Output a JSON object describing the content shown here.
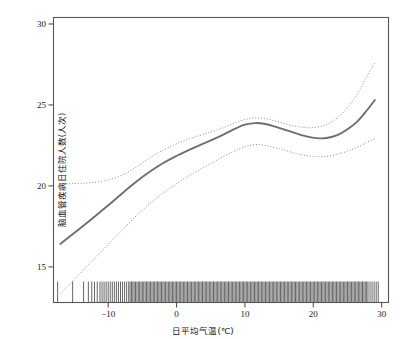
{
  "chart_data": {
    "type": "line",
    "title": "",
    "xlabel": "日平均气温(℃)",
    "ylabel": "脑血管疾病日住院人数(人次)",
    "xlim": [
      -18,
      31
    ],
    "ylim": [
      12.8,
      30.4
    ],
    "xticks": [
      -10,
      0,
      10,
      20,
      30
    ],
    "xtick_labels": [
      "−10",
      "0",
      "10",
      "20",
      "30"
    ],
    "yticks": [
      15,
      20,
      25,
      30
    ],
    "ytick_labels": [
      "15",
      "20",
      "25",
      "30"
    ],
    "grid": false,
    "legend": "none",
    "line_color": "#6e6e73",
    "ci_color": "#8c8c92",
    "rug_color": "#4a4a4a",
    "axis_color": "#555558",
    "series": [
      {
        "name": "estimate",
        "style": "solid",
        "x": [
          -17.0,
          -15.5,
          -14.0,
          -12.5,
          -11.0,
          -9.5,
          -8.0,
          -6.5,
          -5.0,
          -3.5,
          -2.0,
          -0.5,
          1.0,
          2.5,
          4.0,
          5.5,
          7.0,
          8.5,
          10.0,
          11.5,
          13.0,
          14.5,
          16.0,
          17.5,
          19.0,
          20.5,
          22.0,
          23.5,
          25.0,
          26.5,
          28.0,
          29.0
        ],
        "y": [
          16.42,
          16.92,
          17.42,
          17.93,
          18.45,
          18.98,
          19.52,
          20.05,
          20.55,
          21.0,
          21.4,
          21.75,
          22.06,
          22.35,
          22.62,
          22.9,
          23.2,
          23.52,
          23.78,
          23.88,
          23.82,
          23.65,
          23.45,
          23.24,
          23.06,
          22.95,
          22.96,
          23.13,
          23.5,
          24.0,
          24.75,
          25.3
        ]
      },
      {
        "name": "upper_confidence_limit",
        "style": "dotted",
        "x": [
          -17.0,
          -15.5,
          -14.0,
          -12.5,
          -11.0,
          -9.5,
          -8.0,
          -6.5,
          -5.0,
          -3.5,
          -2.0,
          -0.5,
          1.0,
          2.5,
          4.0,
          5.5,
          7.0,
          8.5,
          10.0,
          11.5,
          13.0,
          14.5,
          16.0,
          17.5,
          19.0,
          20.5,
          22.0,
          23.5,
          25.0,
          26.5,
          28.0,
          29.0
        ],
        "y": [
          20.15,
          20.14,
          20.16,
          20.2,
          20.28,
          20.42,
          20.66,
          21.0,
          21.42,
          21.85,
          22.2,
          22.5,
          22.78,
          23.0,
          23.2,
          23.4,
          23.62,
          23.88,
          24.1,
          24.2,
          24.15,
          24.0,
          23.82,
          23.68,
          23.6,
          23.62,
          23.8,
          24.2,
          24.85,
          25.7,
          26.9,
          27.6
        ]
      },
      {
        "name": "lower_confidence_limit",
        "style": "dotted",
        "x": [
          -17.0,
          -15.5,
          -14.0,
          -12.5,
          -11.0,
          -9.5,
          -8.0,
          -6.5,
          -5.0,
          -3.5,
          -2.0,
          -0.5,
          1.0,
          2.5,
          4.0,
          5.5,
          7.0,
          8.5,
          10.0,
          11.5,
          13.0,
          14.5,
          16.0,
          17.5,
          19.0,
          20.5,
          22.0,
          23.5,
          25.0,
          26.5,
          28.0,
          29.0
        ],
        "y": [
          13.35,
          14.0,
          14.65,
          15.3,
          15.95,
          16.6,
          17.25,
          17.9,
          18.5,
          19.05,
          19.55,
          20.0,
          20.42,
          20.8,
          21.15,
          21.5,
          21.85,
          22.15,
          22.42,
          22.55,
          22.5,
          22.35,
          22.18,
          22.0,
          21.88,
          21.8,
          21.82,
          21.95,
          22.15,
          22.4,
          22.72,
          22.9
        ]
      }
    ],
    "rug": {
      "name": "observation-rug",
      "x": [
        -17.4,
        -15.2,
        -13.6,
        -12.9,
        -12.4,
        -12.0,
        -11.6,
        -11.2,
        -10.9,
        -10.6,
        -10.3,
        -10.0,
        -9.7,
        -9.4,
        -9.1,
        -8.8,
        -8.5,
        -8.2,
        -7.9,
        -7.6,
        -7.3,
        -7.0,
        -6.8,
        -6.6,
        -6.4,
        -6.2,
        -6.0,
        -5.8,
        -5.6,
        -5.4,
        -5.2,
        -5.0,
        -4.8,
        -4.6,
        -4.4,
        -4.2,
        -4.0,
        -3.8,
        -3.6,
        -3.4,
        -3.2,
        -3.0,
        -2.8,
        -2.6,
        -2.4,
        -2.2,
        -2.0,
        -1.8,
        -1.6,
        -1.4,
        -1.2,
        -1.0,
        -0.8,
        -0.6,
        -0.4,
        -0.2,
        0.0,
        0.2,
        0.4,
        0.6,
        0.8,
        1.0,
        1.2,
        1.4,
        1.6,
        1.8,
        2.0,
        2.2,
        2.4,
        2.6,
        2.8,
        3.0,
        3.2,
        3.4,
        3.6,
        3.8,
        4.0,
        4.2,
        4.4,
        4.6,
        4.8,
        5.0,
        5.2,
        5.4,
        5.6,
        5.8,
        6.0,
        6.2,
        6.4,
        6.6,
        6.8,
        7.0,
        7.2,
        7.4,
        7.6,
        7.8,
        8.0,
        8.2,
        8.4,
        8.6,
        8.8,
        9.0,
        9.2,
        9.4,
        9.6,
        9.8,
        10.0,
        10.2,
        10.4,
        10.6,
        10.8,
        11.0,
        11.2,
        11.4,
        11.6,
        11.8,
        12.0,
        12.2,
        12.4,
        12.6,
        12.8,
        13.0,
        13.2,
        13.4,
        13.6,
        13.8,
        14.0,
        14.2,
        14.4,
        14.6,
        14.8,
        15.0,
        15.2,
        15.4,
        15.6,
        15.8,
        16.0,
        16.2,
        16.4,
        16.6,
        16.8,
        17.0,
        17.2,
        17.4,
        17.6,
        17.8,
        18.0,
        18.2,
        18.4,
        18.6,
        18.8,
        19.0,
        19.2,
        19.4,
        19.6,
        19.8,
        20.0,
        20.2,
        20.4,
        20.6,
        20.8,
        21.0,
        21.2,
        21.4,
        21.6,
        21.8,
        22.0,
        22.2,
        22.4,
        22.6,
        22.8,
        23.0,
        23.2,
        23.4,
        23.6,
        23.8,
        24.0,
        24.2,
        24.4,
        24.6,
        24.8,
        25.0,
        25.2,
        25.4,
        25.6,
        25.8,
        26.0,
        26.2,
        26.4,
        26.6,
        26.8,
        27.0,
        27.2,
        27.4,
        27.6,
        27.8,
        28.0,
        28.3,
        28.6,
        28.9,
        29.2,
        29.5
      ]
    }
  },
  "axes": {
    "y_axis_name": "y-axis",
    "x_axis_name": "x-axis"
  }
}
